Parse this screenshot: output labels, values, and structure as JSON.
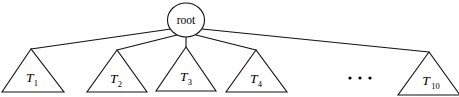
{
  "diagram": {
    "type": "tree",
    "background_color": "#ffffff",
    "stroke_color": "#111111",
    "width": 459,
    "height": 97,
    "root": {
      "label": "root",
      "shape": "ellipse",
      "cx": 186,
      "cy": 20,
      "rx": 18.5,
      "ry": 17
    },
    "ellipsis": {
      "label": "...",
      "dot_count": 3,
      "cx": 360,
      "cy": 78,
      "spacing": 10
    },
    "children": [
      {
        "label": "T",
        "subscript": "1",
        "shape": "triangle",
        "apex_x": 31,
        "apex_y": 49,
        "base_y": 92,
        "base_left_x": 2,
        "base_right_x": 64,
        "label_x": 32,
        "label_y": 82
      },
      {
        "label": "T",
        "subscript": "2",
        "shape": "triangle",
        "apex_x": 117,
        "apex_y": 50,
        "base_y": 92,
        "base_left_x": 87,
        "base_right_x": 147,
        "label_x": 116,
        "label_y": 83
      },
      {
        "label": "T",
        "subscript": "3",
        "shape": "triangle",
        "apex_x": 186,
        "apex_y": 47,
        "base_y": 91,
        "base_left_x": 156,
        "base_right_x": 216,
        "label_x": 186,
        "label_y": 81
      },
      {
        "label": "T",
        "subscript": "4",
        "shape": "triangle",
        "apex_x": 256,
        "apex_y": 50,
        "base_y": 92,
        "base_left_x": 226,
        "base_right_x": 287,
        "label_x": 256,
        "label_y": 83
      },
      {
        "label": "T",
        "subscript": "10",
        "shape": "triangle",
        "apex_x": 429,
        "apex_y": 52,
        "base_y": 95,
        "base_left_x": 398,
        "base_right_x": 460,
        "label_x": 428,
        "label_y": 85
      }
    ],
    "edges": [
      {
        "from": "root",
        "to": "T1",
        "x1": 171,
        "y1": 29,
        "x2": 31,
        "y2": 49
      },
      {
        "from": "root",
        "to": "T2",
        "x1": 177,
        "y1": 35,
        "x2": 117,
        "y2": 50
      },
      {
        "from": "root",
        "to": "T3",
        "x1": 186,
        "y1": 37,
        "x2": 186,
        "y2": 47
      },
      {
        "from": "root",
        "to": "T4",
        "x1": 196,
        "y1": 35,
        "x2": 256,
        "y2": 50
      },
      {
        "from": "root",
        "to": "T10",
        "x1": 202,
        "y1": 29,
        "x2": 429,
        "y2": 52
      }
    ]
  }
}
